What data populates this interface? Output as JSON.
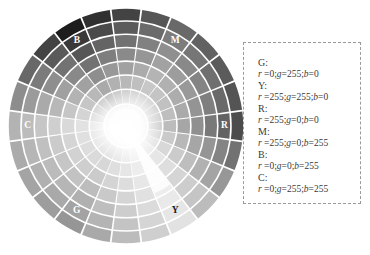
{
  "figure": {
    "type": "color-wheel-diagram",
    "background": "#ffffff"
  },
  "wheel": {
    "name": "hsv-color-wheel",
    "center": {
      "x": 118,
      "y": 118
    },
    "radius": 118,
    "sectors": 24,
    "rings": 8,
    "separator_color": "#ffffff",
    "render_mode": "grayscale",
    "labels": [
      {
        "text": "M",
        "angle_deg": 300,
        "ring": 6,
        "color": "light"
      },
      {
        "text": "R",
        "angle_deg": 0,
        "ring": 6,
        "color": "light"
      },
      {
        "text": "Y",
        "angle_deg": 60,
        "ring": 6,
        "color": "dark"
      },
      {
        "text": "G",
        "angle_deg": 120,
        "ring": 6,
        "color": "light"
      },
      {
        "text": "C",
        "angle_deg": 180,
        "ring": 6,
        "color": "light"
      },
      {
        "text": "B",
        "angle_deg": 240,
        "ring": 6,
        "color": "light"
      }
    ],
    "hues": [
      {
        "key": "R",
        "hue_deg": 0,
        "hex": "#ff0000"
      },
      {
        "key": "Y",
        "hue_deg": 60,
        "hex": "#ffff00"
      },
      {
        "key": "G",
        "hue_deg": 120,
        "hex": "#00ff00"
      },
      {
        "key": "C",
        "hue_deg": 180,
        "hex": "#00ffff"
      },
      {
        "key": "B",
        "hue_deg": 240,
        "hex": "#0000ff"
      },
      {
        "key": "M",
        "hue_deg": 300,
        "hex": "#ff00ff"
      }
    ]
  },
  "legend": {
    "name": "rgb-value-legend",
    "border_style": "dashed",
    "border_color": "#9a9a9a",
    "entries": [
      {
        "key": "G:",
        "r": "0",
        "g": "255",
        "b": "0",
        "value": "r =0;g=255;b=0"
      },
      {
        "key": "Y:",
        "r": "255",
        "g": "255",
        "b": "0",
        "value": "r =255;g=255;b=0"
      },
      {
        "key": "R:",
        "r": "255",
        "g": "0",
        "b": "0",
        "value": "r =255;g=0;b=0"
      },
      {
        "key": "M:",
        "r": "255",
        "g": "0",
        "b": "255",
        "value": "r =255;g=0;b=255"
      },
      {
        "key": "B:",
        "r": "0",
        "g": "0",
        "b": "255",
        "value": "r =0;g=0;b=255"
      },
      {
        "key": "C:",
        "r": "0",
        "g": "255",
        "b": "255",
        "value": "r =0;g=255;b=255"
      }
    ]
  },
  "chart_data": {
    "type": "pie",
    "title": "",
    "categories": [
      "R",
      "Y",
      "G",
      "C",
      "B",
      "M"
    ],
    "values": [
      60,
      60,
      60,
      60,
      60,
      60
    ],
    "xlabel": "",
    "ylabel": "",
    "legend_position": "right",
    "grid": false,
    "annotations": [
      "M",
      "R",
      "Y",
      "G",
      "C",
      "B"
    ]
  }
}
